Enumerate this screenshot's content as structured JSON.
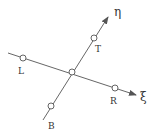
{
  "diagram": {
    "type": "rotated coordinate axes with stencil points",
    "axes": [
      {
        "name": "xi",
        "label": "ξ",
        "from": [
          8,
          53
        ],
        "to": [
          136,
          95
        ]
      },
      {
        "name": "eta",
        "label": "η",
        "from": [
          43,
          120
        ],
        "to": [
          108,
          17
        ]
      }
    ],
    "nodes": [
      {
        "id": "center",
        "label": "",
        "x": 72,
        "y": 72
      },
      {
        "id": "L",
        "label": "L",
        "x": 23,
        "y": 58,
        "label_x": 21,
        "label_y": 74
      },
      {
        "id": "R",
        "label": "R",
        "x": 115,
        "y": 88,
        "label_x": 112,
        "label_y": 104
      },
      {
        "id": "T",
        "label": "T",
        "x": 94,
        "y": 38,
        "label_x": 97,
        "label_y": 52
      },
      {
        "id": "B",
        "label": "B",
        "x": 51,
        "y": 106,
        "label_x": 50,
        "label_y": 129
      }
    ],
    "axis_labels": {
      "xi": {
        "text": "ξ",
        "x": 141,
        "y": 101
      },
      "eta": {
        "text": "η",
        "x": 115,
        "y": 16
      }
    },
    "colors": {
      "line": "#555555",
      "text": "#333333",
      "background": "#ffffff"
    }
  }
}
